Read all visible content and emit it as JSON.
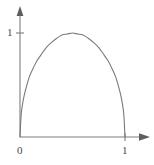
{
  "figure": {
    "name": "parabolic-arch-plot",
    "background_color": "#ffffff",
    "axis_color": "#7d7d7d",
    "curve_color": "#7a7a7a",
    "label_color": "#4a4a4a"
  },
  "labels": {
    "y_one": "1",
    "origin": "0",
    "x_one": "1"
  },
  "chart_data": {
    "type": "line",
    "title": "",
    "xlabel": "",
    "ylabel": "",
    "xlim": [
      0,
      1.18
    ],
    "ylim": [
      0,
      1.18
    ],
    "grid": false,
    "legend": "none",
    "xticks": [
      0,
      1
    ],
    "xticklabels": [
      "0",
      "1"
    ],
    "yticks": [
      1
    ],
    "yticklabels": [
      "1"
    ],
    "axis_arrows": [
      "x-right",
      "y-up"
    ],
    "annotations": [],
    "series": [
      {
        "name": "arch-curve",
        "description": "Dome shaped curve rising steeply from the origin (0,0), peaking at about (0.5, 1.0), and falling steeply back to (1,0)",
        "x": [
          0.0,
          0.01,
          0.02,
          0.04,
          0.06,
          0.09,
          0.12,
          0.16,
          0.2,
          0.25,
          0.3,
          0.35,
          0.4,
          0.45,
          0.5,
          0.55,
          0.6,
          0.65,
          0.7,
          0.75,
          0.8,
          0.84,
          0.88,
          0.91,
          0.94,
          0.96,
          0.98,
          0.99,
          1.0
        ],
        "y": [
          0.0,
          0.2,
          0.29,
          0.4,
          0.48,
          0.58,
          0.65,
          0.73,
          0.79,
          0.86,
          0.91,
          0.95,
          0.98,
          0.99,
          1.0,
          0.99,
          0.98,
          0.95,
          0.91,
          0.86,
          0.79,
          0.73,
          0.65,
          0.58,
          0.48,
          0.4,
          0.29,
          0.2,
          0.0
        ]
      }
    ]
  }
}
